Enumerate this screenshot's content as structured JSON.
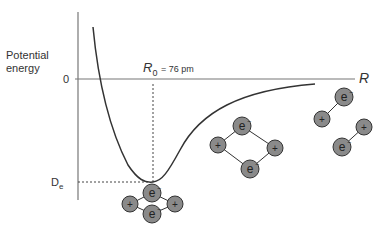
{
  "ylabel": [
    "Potential",
    "energy"
  ],
  "zero_label": "0",
  "xlabel": "R",
  "r0_symbol": "R",
  "r0_sub": "0",
  "r0_value": "= 76 pm",
  "de_symbol": "D",
  "de_sub": "e",
  "particles": {
    "nucleus": "+",
    "electron": "e",
    "electron_sup": "−"
  },
  "colors": {
    "particle_fill": "#8a8a8a",
    "line": "#333333",
    "axis": "#777777"
  }
}
